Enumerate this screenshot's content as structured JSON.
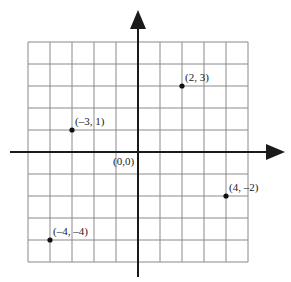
{
  "chart_data": {
    "type": "scatter",
    "title": "",
    "xlabel": "",
    "ylabel": "",
    "xlim": [
      -5,
      5
    ],
    "ylim": [
      -5,
      5
    ],
    "grid": true,
    "origin_label": "(0,0)",
    "points": [
      {
        "x": 2,
        "y": 3,
        "label": "(2, 3)"
      },
      {
        "x": -3,
        "y": 1,
        "label": "(–3, 1)"
      },
      {
        "x": 4,
        "y": -2,
        "label": "(4, –2)"
      },
      {
        "x": -4,
        "y": -4,
        "label": "(–4, –4)"
      }
    ]
  },
  "colors": {
    "grid": "#8a8a8a",
    "axis": "#1a1a1a",
    "point": "#111111"
  }
}
